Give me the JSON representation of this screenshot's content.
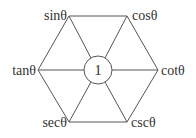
{
  "diagram": {
    "center_label": "1",
    "vertices": [
      {
        "name": "sin",
        "label": "sinθ",
        "x": 69,
        "y": 16
      },
      {
        "name": "cos",
        "label": "cosθ",
        "x": 127,
        "y": 16
      },
      {
        "name": "cot",
        "label": "cotθ",
        "x": 158,
        "y": 70
      },
      {
        "name": "csc",
        "label": "cscθ",
        "x": 127,
        "y": 122
      },
      {
        "name": "sec",
        "label": "secθ",
        "x": 69,
        "y": 122
      },
      {
        "name": "tan",
        "label": "tanθ",
        "x": 38,
        "y": 70
      }
    ],
    "center": {
      "x": 98,
      "y": 70,
      "r": 14
    },
    "colors": {
      "line": "#555555",
      "text": "#333333",
      "background": "#ffffff"
    }
  }
}
